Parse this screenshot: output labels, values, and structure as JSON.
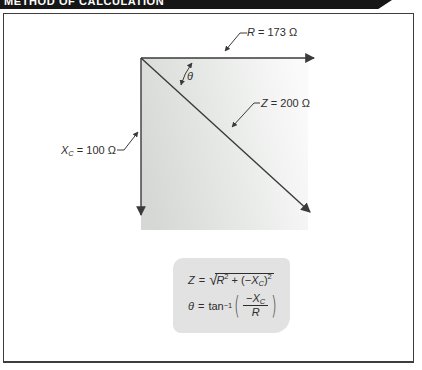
{
  "title": "METHOD OF CALCULATION",
  "diagram": {
    "r_label": {
      "var": "R",
      "rest": " = 173 Ω"
    },
    "z_label": {
      "var": "Z",
      "rest": " = 200 Ω"
    },
    "xc_label": {
      "var": "X",
      "sub": "C",
      "rest": " = 100 Ω"
    },
    "theta_symbol": "θ"
  },
  "formula_box": {
    "f1": {
      "lhs": "Z",
      "eq": "=",
      "radical": "√",
      "rad1": "R",
      "sup1": "2",
      "plus": " + (−",
      "rad2": "X",
      "sub2": "C",
      "close": ")",
      "sup2": "2"
    },
    "f2": {
      "lhs": "θ",
      "eq": "=",
      "fn": "tan",
      "fnsup": "−1",
      "open": "(",
      "num_sign": "−",
      "num_var": "X",
      "num_sub": "C",
      "den": "R",
      "closep": ")"
    }
  },
  "colors": {
    "banner": "#161616",
    "line": "#3a3a3a",
    "shade_dark": "#d6d8d6",
    "shade_light": "#fafafa",
    "formula_bg": "#e2e2e2",
    "frame_border": "#3d3d3d"
  }
}
